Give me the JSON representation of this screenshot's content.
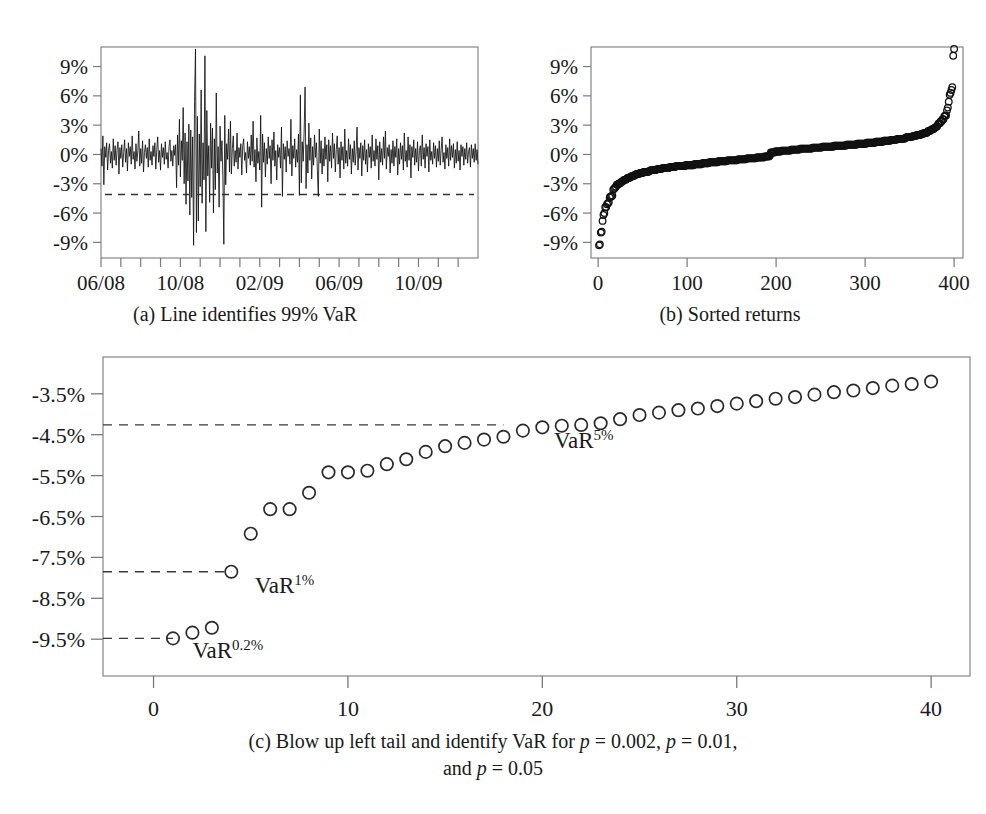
{
  "figure": {
    "panels": [
      {
        "id": "a",
        "subcaption": "(a)  Line identifies 99% VaR",
        "yticks": [
          "9%",
          "6%",
          "3%",
          "0%",
          "-3%",
          "-6%",
          "-9%"
        ],
        "ytick_values": [
          9,
          6,
          3,
          0,
          -3,
          -6,
          -9
        ],
        "xticks": [
          "06/08",
          "10/08",
          "02/09",
          "06/09",
          "10/09"
        ],
        "xtick_values": [
          0,
          4,
          8,
          12,
          16
        ],
        "varline_value": -4.1
      },
      {
        "id": "b",
        "subcaption": "(b)  Sorted returns",
        "yticks": [
          "9%",
          "6%",
          "3%",
          "0%",
          "-3%",
          "-6%",
          "-9%"
        ],
        "ytick_values": [
          9,
          6,
          3,
          0,
          -3,
          -6,
          -9
        ],
        "xticks": [
          "0",
          "100",
          "200",
          "300",
          "400"
        ],
        "xtick_values": [
          0,
          100,
          200,
          300,
          400
        ]
      },
      {
        "id": "c",
        "yticks": [
          "-3.5%",
          "-4.5%",
          "-5.5%",
          "-6.5%",
          "-7.5%",
          "-8.5%",
          "-9.5%"
        ],
        "ytick_values": [
          -3.5,
          -4.5,
          -5.5,
          -6.5,
          -7.5,
          -8.5,
          -9.5
        ],
        "xticks": [
          "0",
          "10",
          "20",
          "30",
          "40"
        ],
        "xtick_values": [
          0,
          10,
          20,
          30,
          40
        ],
        "annotations": [
          {
            "name": "var-0p2",
            "base": "VaR",
            "sup": "0.2%",
            "x": 2.0,
            "y": -9.95
          },
          {
            "name": "var-1",
            "base": "VaR",
            "sup": "1%",
            "x": 5.2,
            "y": -8.38
          },
          {
            "name": "var-5",
            "base": "VaR",
            "sup": "5%",
            "x": 20.6,
            "y": -4.82
          }
        ],
        "varlines": [
          {
            "name": "var-5pct-line",
            "value": -4.26,
            "x_end": 18.0
          },
          {
            "name": "var-1pct-line",
            "value": -7.85,
            "x_end": 4.0
          },
          {
            "name": "var-0p2pct-line",
            "value": -9.48,
            "x_end": 1.0
          }
        ]
      }
    ],
    "main_caption": {
      "line1_pre": "(c)  Blow up left tail and identify VaR for ",
      "p1": "p",
      "eq1": " = 0.002, ",
      "p2": "p",
      "eq2": " = 0.01,",
      "line2_pre": "and ",
      "p3": "p",
      "eq3": " = 0.05"
    }
  },
  "chart_data": [
    {
      "name": "panel-a-returns-timeseries",
      "type": "line",
      "title": "(a)  Line identifies 99% VaR",
      "xlabel": "",
      "ylabel": "",
      "xlim": [
        0,
        19
      ],
      "ylim": [
        -10.6,
        11.0
      ],
      "grid": false,
      "xtick_labels": [
        "06/08",
        "10/08",
        "02/09",
        "06/09",
        "10/09"
      ],
      "xtick_positions": [
        0,
        4,
        8,
        12,
        16
      ],
      "ytick_labels": [
        "9%",
        "6%",
        "3%",
        "0%",
        "-3%",
        "-6%",
        "-9%"
      ],
      "ytick_positions": [
        9,
        6,
        3,
        0,
        -3,
        -6,
        -9
      ],
      "hline": {
        "label": "99% VaR",
        "value": -4.1,
        "style": "dashed"
      },
      "values": [
        0.6,
        -1.2,
        1.9,
        -3.1,
        0.8,
        -0.3,
        1.2,
        -1.6,
        0.4,
        1.1,
        -0.9,
        0.3,
        -1.4,
        1.6,
        -0.6,
        0.9,
        -1.1,
        0.5,
        1.3,
        -2.0,
        0.7,
        -0.4,
        1.0,
        -1.3,
        0.2,
        1.5,
        -0.8,
        0.6,
        -1.7,
        1.2,
        -0.2,
        0.8,
        -1.0,
        1.9,
        -0.5,
        0.3,
        -1.5,
        1.1,
        -0.7,
        0.4,
        2.4,
        -1.2,
        0.6,
        -0.9,
        1.4,
        -1.8,
        0.2,
        1.0,
        -0.4,
        0.7,
        -1.3,
        1.6,
        -0.6,
        0.3,
        -1.1,
        0.9,
        -0.2,
        1.2,
        -1.5,
        0.5,
        1.8,
        -0.8,
        0.4,
        -1.6,
        1.1,
        -0.3,
        0.7,
        -1.0,
        1.3,
        -0.5,
        0.2,
        -1.4,
        0.8,
        1.5,
        -0.7,
        0.4,
        -1.2,
        0.9,
        -0.1,
        1.0,
        -3.4,
        2.0,
        -1.1,
        3.6,
        -2.3,
        1.4,
        -0.6,
        4.8,
        -3.0,
        2.2,
        -5.1,
        1.3,
        -2.7,
        3.1,
        -6.2,
        2.5,
        -4.4,
        1.8,
        -9.3,
        5.4,
        10.8,
        -8.0,
        3.9,
        -6.8,
        2.1,
        -3.3,
        6.6,
        -5.0,
        1.2,
        -2.6,
        10.1,
        -7.9,
        4.5,
        -2.2,
        0.9,
        -4.9,
        3.2,
        -1.4,
        2.7,
        -6.0,
        1.6,
        -3.6,
        6.3,
        -1.9,
        0.8,
        -5.4,
        2.9,
        -0.7,
        1.4,
        -2.4,
        -9.2,
        4.0,
        -3.1,
        1.1,
        -0.5,
        2.6,
        -1.8,
        3.4,
        -2.0,
        0.6,
        1.9,
        -1.2,
        0.4,
        -0.8,
        2.2,
        -1.5,
        0.7,
        -0.3,
        1.1,
        -2.1,
        0.9,
        1.6,
        -0.6,
        0.2,
        -1.9,
        1.3,
        -0.4,
        0.8,
        -1.1,
        2.0,
        -0.7,
        3.4,
        -1.3,
        0.5,
        -2.8,
        1.7,
        -0.9,
        0.3,
        -1.6,
        4.0,
        -5.4,
        2.1,
        -0.8,
        1.2,
        -2.3,
        0.6,
        -1.0,
        1.8,
        -0.4,
        0.9,
        -3.0,
        1.5,
        -0.6,
        2.3,
        -1.2,
        0.4,
        -2.6,
        1.0,
        -0.3,
        0.7,
        -1.4,
        2.8,
        -4.3,
        1.1,
        -0.5,
        0.8,
        -1.8,
        1.4,
        -0.2,
        0.6,
        -1.0,
        3.6,
        -2.2,
        0.9,
        -0.4,
        1.6,
        -1.3,
        0.5,
        -0.8,
        2.1,
        -4.2,
        6.1,
        -2.9,
        1.3,
        -0.7,
        2.4,
        6.9,
        -3.5,
        1.0,
        -1.9,
        3.2,
        -0.6,
        1.7,
        -2.5,
        0.8,
        -1.1,
        2.0,
        -0.3,
        1.2,
        -1.6,
        -4.3,
        2.6,
        -0.9,
        1.4,
        -2.0,
        0.6,
        -1.2,
        1.8,
        -0.5,
        1.0,
        -2.8,
        1.5,
        -0.7,
        0.9,
        -1.4,
        2.2,
        -0.4,
        1.1,
        -1.8,
        0.5,
        1.9,
        -1.0,
        0.7,
        -2.4,
        1.3,
        -0.6,
        0.8,
        -1.5,
        2.6,
        -0.9,
        0.4,
        -1.2,
        1.6,
        -0.5,
        1.0,
        -2.0,
        0.6,
        -0.8,
        1.4,
        -1.1,
        0.3,
        2.8,
        -1.6,
        0.7,
        -0.4,
        1.2,
        -2.2,
        0.9,
        -0.6,
        1.5,
        -1.0,
        0.5,
        -1.8,
        1.1,
        -0.3,
        0.8,
        -1.4,
        2.0,
        -0.7,
        0.4,
        -1.2,
        1.6,
        -0.5,
        0.9,
        -2.6,
        1.3,
        -0.8,
        0.6,
        -1.1,
        1.8,
        -0.4,
        2.4,
        -1.5,
        0.7,
        -0.2,
        1.0,
        -1.9,
        0.5,
        -0.9,
        1.4,
        -1.2,
        0.8,
        -0.3,
        1.6,
        -2.1,
        0.6,
        -1.0,
        1.2,
        -0.5,
        0.9,
        -1.6,
        2.2,
        -0.7,
        0.4,
        -1.3,
        1.8,
        -0.6,
        1.0,
        -2.4,
        0.8,
        -0.3,
        1.5,
        -1.1,
        0.6,
        -0.8,
        1.3,
        -1.7,
        0.4,
        0.9,
        -1.2,
        2.0,
        -0.5,
        0.7,
        -1.4,
        1.1,
        -0.2,
        0.8,
        -1.8,
        1.5,
        -0.6,
        0.3,
        -1.0,
        1.2,
        -0.4,
        0.9,
        -1.3,
        0.6,
        -0.7,
        1.4,
        -1.1,
        0.5,
        1.8,
        -0.8,
        0.2,
        -1.5,
        1.0,
        -0.4,
        0.7,
        -1.2,
        1.6,
        -0.6,
        0.9,
        -0.3,
        1.1,
        -1.4,
        0.5,
        -0.9,
        1.3,
        -0.7,
        0.4,
        -1.6,
        1.0,
        -0.2,
        0.8,
        -1.1,
        0.6,
        -0.5,
        1.2,
        -0.9,
        0.3,
        0.7,
        -1.3,
        1.0,
        -0.4,
        0.6,
        -0.8,
        1.1,
        -0.6,
        0.5,
        -1.0
      ]
    },
    {
      "name": "panel-b-sorted-returns",
      "type": "scatter",
      "title": "(b)  Sorted returns",
      "xlabel": "",
      "ylabel": "",
      "xlim": [
        -8,
        410
      ],
      "ylim": [
        -10.6,
        11.0
      ],
      "grid": false,
      "marker": "open-circle",
      "n_points": 400,
      "xtick_labels": [
        "0",
        "100",
        "200",
        "300",
        "400"
      ],
      "xtick_positions": [
        0,
        100,
        200,
        300,
        400
      ],
      "ytick_labels": [
        "9%",
        "6%",
        "3%",
        "0%",
        "-3%",
        "-6%",
        "-9%"
      ],
      "ytick_positions": [
        9,
        6,
        3,
        0,
        -3,
        -6,
        -9
      ],
      "note": "Sorted (ascending) version of the same 400 daily returns shown in panel (a); the 40 leftmost points are enumerated in panel (c)."
    },
    {
      "name": "panel-c-left-tail-blowup",
      "type": "scatter",
      "title": "(c)  Blow up left tail and identify VaR for p = 0.002, p = 0.01, and p = 0.05",
      "xlabel": "",
      "ylabel": "",
      "xlim": [
        -2.6,
        42
      ],
      "ylim": [
        -10.4,
        -2.6
      ],
      "grid": false,
      "marker": "open-circle",
      "xtick_labels": [
        "0",
        "10",
        "20",
        "30",
        "40"
      ],
      "xtick_positions": [
        0,
        10,
        20,
        30,
        40
      ],
      "ytick_labels": [
        "-3.5%",
        "-4.5%",
        "-5.5%",
        "-6.5%",
        "-7.5%",
        "-8.5%",
        "-9.5%"
      ],
      "ytick_positions": [
        -3.5,
        -4.5,
        -5.5,
        -6.5,
        -7.5,
        -8.5,
        -9.5
      ],
      "x": [
        1,
        2,
        3,
        4,
        5,
        6,
        7,
        8,
        9,
        10,
        11,
        12,
        13,
        14,
        15,
        16,
        17,
        18,
        19,
        20,
        21,
        22,
        23,
        24,
        25,
        26,
        27,
        28,
        29,
        30,
        31,
        32,
        33,
        34,
        35,
        36,
        37,
        38,
        39,
        40
      ],
      "values": [
        -9.48,
        -9.34,
        -9.22,
        -7.85,
        -6.92,
        -6.32,
        -6.32,
        -5.92,
        -5.42,
        -5.42,
        -5.38,
        -5.22,
        -5.1,
        -4.92,
        -4.78,
        -4.7,
        -4.62,
        -4.55,
        -4.4,
        -4.32,
        -4.28,
        -4.26,
        -4.22,
        -4.12,
        -4.02,
        -3.96,
        -3.9,
        -3.86,
        -3.8,
        -3.74,
        -3.68,
        -3.62,
        -3.58,
        -3.52,
        -3.46,
        -3.42,
        -3.36,
        -3.3,
        -3.26,
        -3.2
      ],
      "hlines": [
        {
          "label": "VaR 5%",
          "value": -4.26,
          "style": "dashed",
          "x_end": 18.0
        },
        {
          "label": "VaR 1%",
          "value": -7.85,
          "style": "dashed",
          "x_end": 4.0
        },
        {
          "label": "VaR 0.2%",
          "value": -9.48,
          "style": "dashed",
          "x_end": 1.0
        }
      ],
      "annotations": [
        {
          "text": "VaR0.2%",
          "x": 2.0,
          "y": -9.95
        },
        {
          "text": "VaR1%",
          "x": 5.2,
          "y": -8.38
        },
        {
          "text": "VaR5%",
          "x": 20.6,
          "y": -4.82
        }
      ]
    }
  ]
}
